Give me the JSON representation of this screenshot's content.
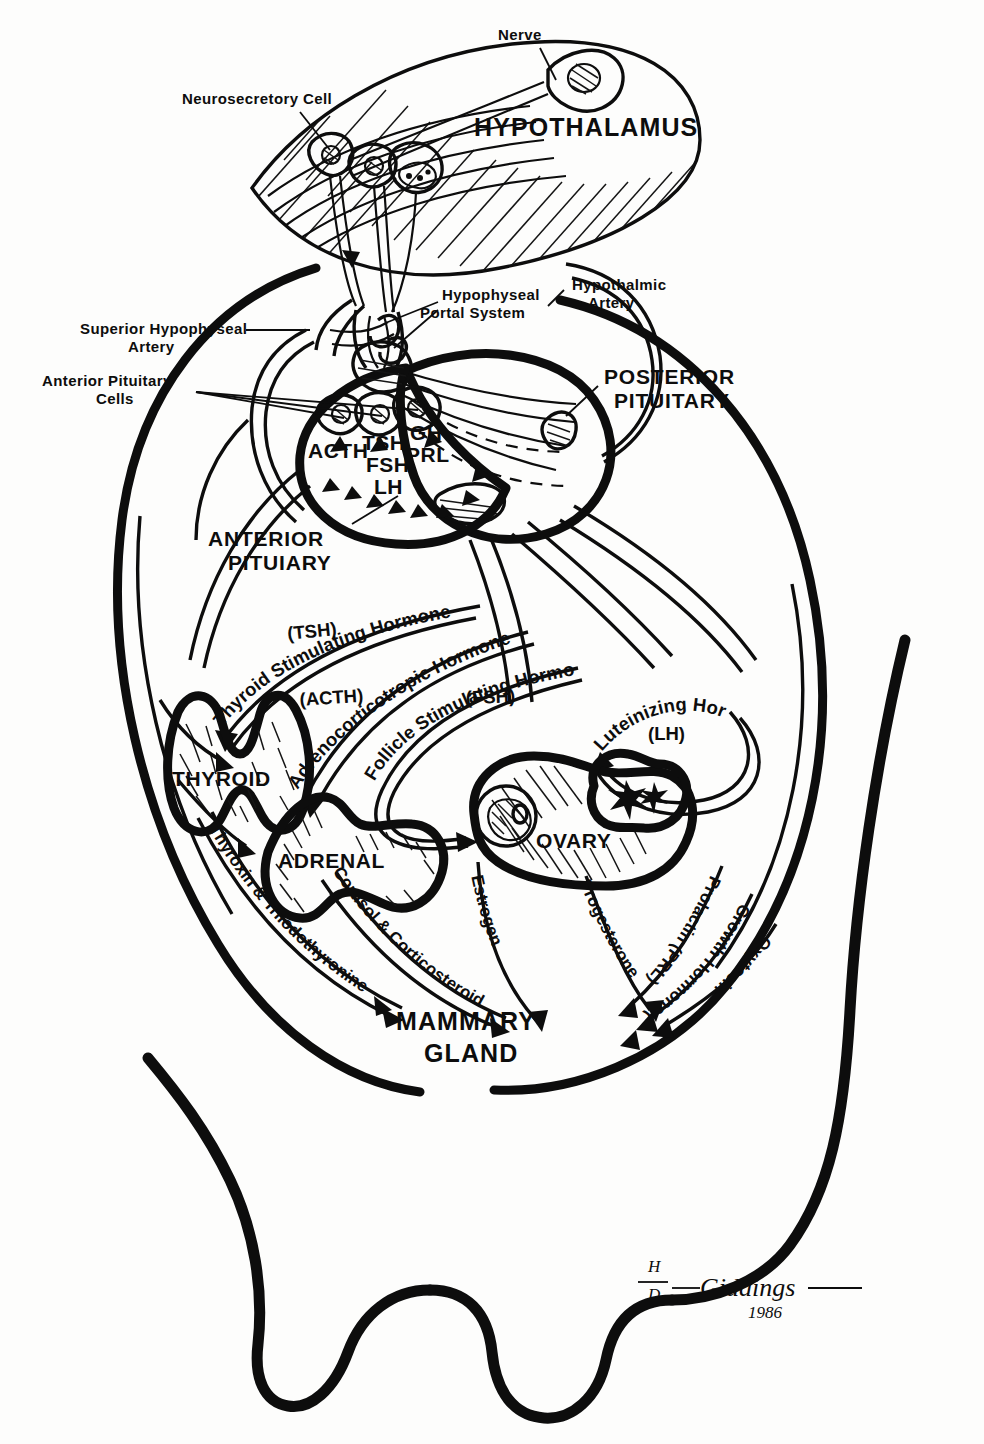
{
  "figure": {
    "artist": "Giddings",
    "year": "1986",
    "ink_color": "#0d0d0d",
    "paper_color": "#fdfdfc"
  },
  "callouts": {
    "nerve": "Nerve",
    "neurosecretory_cell": "Neurosecretory Cell",
    "superior_hypophyseal_artery_l1": "Superior Hypophyseal",
    "superior_hypophyseal_artery_l2": "Artery",
    "anterior_pituitary_cells_l1": "Anterior Pituitary",
    "anterior_pituitary_cells_l2": "Cells",
    "hypophyseal_portal_l1": "Hypophyseal",
    "hypophyseal_portal_l2": "Portal  System",
    "hypothalmic_artery_l1": "Hypothalmic",
    "hypothalmic_artery_l2": "Artery"
  },
  "regions": {
    "hypothalamus": "HYPOTHALAMUS",
    "posterior_pituitary_l1": "POSTERIOR",
    "posterior_pituitary_l2": "PITUITARY",
    "anterior_pituitary_l1": "ANTERIOR",
    "anterior_pituitary_l2": "PITUIARY",
    "mammary_gland_l1": "MAMMARY",
    "mammary_gland_l2": "GLAND"
  },
  "pituitary_hormone_abbr": {
    "acth": "ACTH",
    "tsh": "TSH",
    "fsh": "FSH",
    "lh": "LH",
    "gh": "GH",
    "prl": "PRL"
  },
  "target_organs": [
    {
      "name": "THYROID"
    },
    {
      "name": "ADRENAL"
    },
    {
      "name": "OVARY"
    }
  ],
  "tropic_hormones": [
    {
      "abbr": "(TSH)",
      "name": "Thyroid Stimulating Hormone",
      "target": "THYROID"
    },
    {
      "abbr": "(ACTH)",
      "name": "Adrenocorticotropic Hormone",
      "target": "ADRENAL"
    },
    {
      "abbr": "(FSH)",
      "name": "Follicle Stimulating Hormone",
      "target": "OVARY"
    },
    {
      "abbr": "(LH)",
      "name": "Luteinizing Hormone",
      "target": "OVARY"
    }
  ],
  "effector_hormones": [
    {
      "name": "Thyroxin & Triiodothyronine",
      "source": "THYROID"
    },
    {
      "name": "Cortisol & Corticosteroid",
      "source": "ADRENAL"
    },
    {
      "name": "Estrogen",
      "source": "OVARY"
    },
    {
      "name": "Progesterone",
      "source": "OVARY"
    },
    {
      "name": "Prolactin (PRL)",
      "source": "ANTERIOR PITUITARY"
    },
    {
      "name": "Growth Hormone (GH)",
      "source": "ANTERIOR PITUITARY"
    },
    {
      "name": "Oxytocin",
      "source": "POSTERIOR PITUITARY"
    }
  ],
  "signature": {
    "monogram": "H",
    "monogram2": "D",
    "name": "Giddings",
    "year": "1986"
  }
}
